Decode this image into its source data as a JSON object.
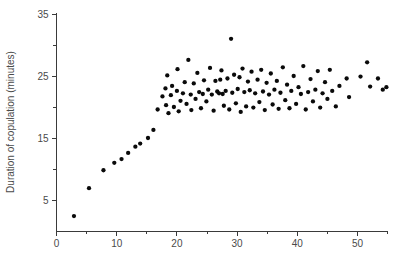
{
  "chart_data": {
    "type": "scatter",
    "title": "",
    "subtitle": "",
    "xlabel": "",
    "ylabel": "Duration of copulation (minutes)",
    "xlim": [
      0,
      55.5
    ],
    "ylim": [
      0,
      36
    ],
    "grid": false,
    "legend": null,
    "marker": {
      "shape": "circle",
      "color": "#0a0a0a",
      "size_px": 4.3
    },
    "x_ticks_major": [
      0,
      10,
      20,
      30,
      40,
      50
    ],
    "x_tick_labels": [
      "0",
      "10",
      "20",
      "30",
      "40",
      "50"
    ],
    "x_ticks_minor": [
      5,
      15,
      25,
      35,
      45,
      55
    ],
    "y_ticks_major": [
      5,
      15,
      25,
      35
    ],
    "y_tick_labels": [
      "5",
      "15",
      "25",
      "35"
    ],
    "y_ticks_minor": [
      10,
      20,
      30
    ],
    "points": [
      [
        2.9,
        2.4
      ],
      [
        5.4,
        6.9
      ],
      [
        7.8,
        9.8
      ],
      [
        9.6,
        11.0
      ],
      [
        10.8,
        11.6
      ],
      [
        11.9,
        12.6
      ],
      [
        13.1,
        13.6
      ],
      [
        13.9,
        14.1
      ],
      [
        15.2,
        15.0
      ],
      [
        16.1,
        16.3
      ],
      [
        16.8,
        19.6
      ],
      [
        17.6,
        21.7
      ],
      [
        18.1,
        23.0
      ],
      [
        18.2,
        20.3
      ],
      [
        18.4,
        25.1
      ],
      [
        18.6,
        19.0
      ],
      [
        19.0,
        21.9
      ],
      [
        19.2,
        23.4
      ],
      [
        19.5,
        20.0
      ],
      [
        20.0,
        22.6
      ],
      [
        20.1,
        26.1
      ],
      [
        20.3,
        19.3
      ],
      [
        20.6,
        21.0
      ],
      [
        21.0,
        22.2
      ],
      [
        21.3,
        24.0
      ],
      [
        21.6,
        20.5
      ],
      [
        21.9,
        27.6
      ],
      [
        22.3,
        22.0
      ],
      [
        22.4,
        19.5
      ],
      [
        22.8,
        23.8
      ],
      [
        23.1,
        21.3
      ],
      [
        23.4,
        25.5
      ],
      [
        23.7,
        22.4
      ],
      [
        24.0,
        19.8
      ],
      [
        24.3,
        22.1
      ],
      [
        24.5,
        24.3
      ],
      [
        24.9,
        20.9
      ],
      [
        25.2,
        22.8
      ],
      [
        25.5,
        26.3
      ],
      [
        25.8,
        22.0
      ],
      [
        26.1,
        19.4
      ],
      [
        26.4,
        24.2
      ],
      [
        26.7,
        22.5
      ],
      [
        27.0,
        22.2
      ],
      [
        27.2,
        24.4
      ],
      [
        27.4,
        25.9
      ],
      [
        27.6,
        22.1
      ],
      [
        27.8,
        20.2
      ],
      [
        28.1,
        22.6
      ],
      [
        28.4,
        24.6
      ],
      [
        28.7,
        19.6
      ],
      [
        29.0,
        31.0
      ],
      [
        29.2,
        22.3
      ],
      [
        29.5,
        25.2
      ],
      [
        29.8,
        20.6
      ],
      [
        30.1,
        22.9
      ],
      [
        30.4,
        24.8
      ],
      [
        30.6,
        19.2
      ],
      [
        30.9,
        26.2
      ],
      [
        31.2,
        22.4
      ],
      [
        31.5,
        20.1
      ],
      [
        31.8,
        24.1
      ],
      [
        32.1,
        22.7
      ],
      [
        32.4,
        25.7
      ],
      [
        32.7,
        19.9
      ],
      [
        33.0,
        22.2
      ],
      [
        33.4,
        24.4
      ],
      [
        33.7,
        20.8
      ],
      [
        34.0,
        26.0
      ],
      [
        34.3,
        22.5
      ],
      [
        34.6,
        19.5
      ],
      [
        34.9,
        23.9
      ],
      [
        35.3,
        22.0
      ],
      [
        35.6,
        25.4
      ],
      [
        35.9,
        20.4
      ],
      [
        36.2,
        22.8
      ],
      [
        36.6,
        24.2
      ],
      [
        36.9,
        19.7
      ],
      [
        37.2,
        22.3
      ],
      [
        37.6,
        26.4
      ],
      [
        38.0,
        21.1
      ],
      [
        38.3,
        23.6
      ],
      [
        38.7,
        19.8
      ],
      [
        39.0,
        22.6
      ],
      [
        39.4,
        25.0
      ],
      [
        39.8,
        20.5
      ],
      [
        40.2,
        23.2
      ],
      [
        40.6,
        22.1
      ],
      [
        41.0,
        26.6
      ],
      [
        41.4,
        19.6
      ],
      [
        41.8,
        22.4
      ],
      [
        42.2,
        24.5
      ],
      [
        42.6,
        20.9
      ],
      [
        43.0,
        22.8
      ],
      [
        43.4,
        25.8
      ],
      [
        43.8,
        19.9
      ],
      [
        44.2,
        22.2
      ],
      [
        44.6,
        24.0
      ],
      [
        45.0,
        21.3
      ],
      [
        45.4,
        26.0
      ],
      [
        45.8,
        22.6
      ],
      [
        46.4,
        20.1
      ],
      [
        47.0,
        23.4
      ],
      [
        48.2,
        24.6
      ],
      [
        48.6,
        21.6
      ],
      [
        50.5,
        24.9
      ],
      [
        51.6,
        27.2
      ],
      [
        52.1,
        23.3
      ],
      [
        53.4,
        24.6
      ],
      [
        54.2,
        22.8
      ],
      [
        54.8,
        23.2
      ]
    ]
  },
  "axes": {
    "y_axis_name": "y-axis",
    "x_axis_name": "x-axis"
  }
}
